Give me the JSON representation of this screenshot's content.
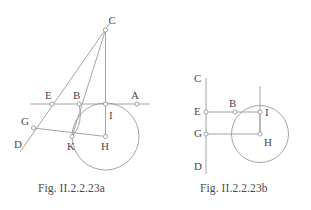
{
  "document": {
    "background_color": "#ffffff",
    "stroke_color": "#9a9a9a",
    "label_color": "#4a4a4a",
    "node_fill": "#ffffff"
  },
  "figures": [
    {
      "id": "figure-a",
      "caption": "Fig. II.2.2.23a",
      "points": [
        {
          "name": "C",
          "x": 105.5,
          "y": 30.0,
          "label_x": 108.5,
          "label_y": 24.0,
          "marker": true
        },
        {
          "name": "E",
          "x": 52.0,
          "y": 104.0,
          "label_x": 45.0,
          "label_y": 99.0,
          "marker": true
        },
        {
          "name": "B",
          "x": 79.0,
          "y": 104.0,
          "label_x": 73.0,
          "label_y": 98.5,
          "marker": true
        },
        {
          "name": "A",
          "x": 137.0,
          "y": 104.0,
          "label_x": 131.0,
          "label_y": 98.5,
          "marker": true
        },
        {
          "name": "I",
          "x": 105.5,
          "y": 104.0,
          "label_x": 109.0,
          "label_y": 119.0,
          "marker": true
        },
        {
          "name": "G",
          "x": 33.5,
          "y": 128.0,
          "label_x": 21.0,
          "label_y": 125.0,
          "marker": true
        },
        {
          "name": "D",
          "x": 25.0,
          "y": 146.0,
          "label_x": 14.0,
          "label_y": 148.0,
          "marker": false
        },
        {
          "name": "K",
          "x": 72.0,
          "y": 136.5,
          "label_x": 67.0,
          "label_y": 150.0,
          "marker": true
        },
        {
          "name": "H",
          "x": 105.5,
          "y": 136.5,
          "label_x": 101.0,
          "label_y": 150.0,
          "marker": true
        }
      ],
      "circle": {
        "center": "H",
        "cx": 105.5,
        "cy": 136.5,
        "r": 33.5
      },
      "segments": [
        {
          "from": "C",
          "to": "H",
          "name": "segment-C-H"
        },
        {
          "from": "C",
          "to": "K",
          "name": "segment-C-K"
        },
        {
          "from": "G",
          "to": "H",
          "name": "segment-G-H"
        }
      ],
      "lines": [
        {
          "name": "line-E-A-horizontal",
          "x1": 30.0,
          "y1": 104.0,
          "x2": 150.0,
          "y2": 104.0
        },
        {
          "name": "line-C-D-slanted",
          "x1": 110.0,
          "y1": 23.0,
          "x2": 20.0,
          "y2": 152.0
        }
      ],
      "arcs": [
        {
          "name": "arc-B-K",
          "x1": 79.0,
          "y1": 104.0,
          "x2": 72.0,
          "y2": 136.5,
          "rx": 34.0,
          "ry": 34.0,
          "sweep": 1
        }
      ]
    },
    {
      "id": "figure-b",
      "caption": "Fig. II.2.2.23b",
      "points": [
        {
          "name": "C",
          "x": 206.0,
          "y": 82.0,
          "label_x": 194.0,
          "label_y": 82.0,
          "marker": false
        },
        {
          "name": "E",
          "x": 206.0,
          "y": 112.0,
          "label_x": 194.0,
          "label_y": 115.0,
          "marker": true
        },
        {
          "name": "B",
          "x": 235.0,
          "y": 112.0,
          "label_x": 229.0,
          "label_y": 106.5,
          "marker": true
        },
        {
          "name": "I",
          "x": 260.0,
          "y": 112.0,
          "label_x": 265.0,
          "label_y": 116.0,
          "marker": true
        },
        {
          "name": "G",
          "x": 206.0,
          "y": 134.0,
          "label_x": 194.0,
          "label_y": 137.0,
          "marker": true
        },
        {
          "name": "H",
          "x": 260.0,
          "y": 134.0,
          "label_x": 264.0,
          "label_y": 146.0,
          "marker": true
        },
        {
          "name": "D",
          "x": 206.0,
          "y": 168.0,
          "label_x": 194.0,
          "label_y": 170.0,
          "marker": false
        }
      ],
      "circle": {
        "center": "H",
        "cx": 260.0,
        "cy": 134.0,
        "r": 28.5
      },
      "segments": [
        {
          "from": "E",
          "to": "I",
          "name": "segment-E-I"
        },
        {
          "from": "G",
          "to": "H",
          "name": "segment-G-H"
        },
        {
          "from": "I",
          "to": "H",
          "name": "segment-I-H"
        }
      ],
      "lines": [
        {
          "name": "line-C-D-vertical",
          "x1": 206.0,
          "y1": 78.0,
          "x2": 206.0,
          "y2": 174.0
        },
        {
          "name": "line-I-vertical",
          "x1": 260.0,
          "y1": 86.0,
          "x2": 260.0,
          "y2": 134.0
        }
      ],
      "arcs": []
    }
  ]
}
